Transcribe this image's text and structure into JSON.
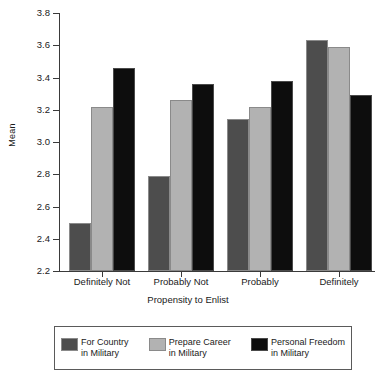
{
  "chart_data": {
    "type": "bar",
    "title": "",
    "xlabel": "Propensity to Enlist",
    "ylabel": "Mean",
    "categories": [
      "Definitely Not",
      "Probably Not",
      "Probably",
      "Definitely"
    ],
    "series": [
      {
        "name": "For Country in Military",
        "label_line1": "For Country",
        "label_line2": "in Military",
        "color": "#4d4d4d",
        "values": [
          2.5,
          2.79,
          3.14,
          3.63
        ]
      },
      {
        "name": "Prepare Career in Military",
        "label_line1": "Prepare Career",
        "label_line2": "in Military",
        "color": "#b2b2b2",
        "values": [
          3.22,
          3.26,
          3.22,
          3.59
        ]
      },
      {
        "name": "Personal Freedom in Military",
        "label_line1": "Personal Freedom",
        "label_line2": "in Military",
        "color": "#0d0d0d",
        "values": [
          3.46,
          3.36,
          3.38,
          3.29
        ]
      }
    ],
    "ylim": [
      2.2,
      3.8
    ],
    "ytick_labels": [
      "3.8",
      "3.6",
      "3.4",
      "3.2",
      "3.0",
      "2.8",
      "2.6",
      "2.4",
      "2.2"
    ],
    "ytick_values": [
      3.8,
      3.6,
      3.4,
      3.2,
      3.0,
      2.8,
      2.6,
      2.4,
      2.2
    ],
    "grid": false,
    "legend_position": "bottom"
  }
}
